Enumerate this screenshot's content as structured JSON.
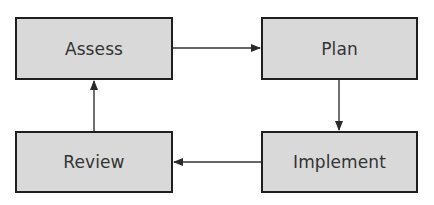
{
  "diagram": {
    "type": "cycle-flowchart",
    "colors": {
      "box_fill": "#d9d9d9",
      "box_border": "#1f1f1f",
      "text": "#333333",
      "arrow": "#333333",
      "background": "#ffffff"
    },
    "nodes": [
      {
        "id": "assess",
        "label": "Assess"
      },
      {
        "id": "plan",
        "label": "Plan"
      },
      {
        "id": "implement",
        "label": "Implement"
      },
      {
        "id": "review",
        "label": "Review"
      }
    ],
    "edges": [
      {
        "from": "assess",
        "to": "plan"
      },
      {
        "from": "plan",
        "to": "implement"
      },
      {
        "from": "implement",
        "to": "review"
      },
      {
        "from": "review",
        "to": "assess"
      }
    ]
  }
}
